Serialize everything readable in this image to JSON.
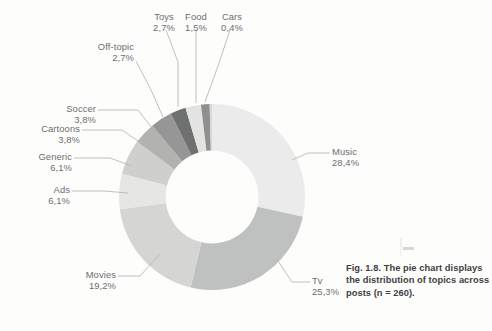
{
  "figure": {
    "caption": "Fig. 1.8. The pie chart displays the distribution of topics across posts (n = 260)."
  },
  "chart_data": {
    "type": "pie",
    "title": "",
    "subtitle": "",
    "xlabel": "",
    "ylabel": "",
    "legend_position": "none",
    "grid": false,
    "donut": true,
    "inner_radius_ratio": 0.5,
    "total_n": 260,
    "value_unit": "percent",
    "decimal_separator": ",",
    "start_angle_deg": -90,
    "direction": "clockwise",
    "categories": [
      "Music",
      "Tv",
      "Movies",
      "Ads",
      "Generic",
      "Cartoons",
      "Soccer",
      "Off-topic",
      "Toys",
      "Food",
      "Cars"
    ],
    "values": [
      28.4,
      25.3,
      19.2,
      6.1,
      6.1,
      3.8,
      3.8,
      2.7,
      2.7,
      1.5,
      0.4
    ],
    "value_labels": [
      "28,4%",
      "25,3%",
      "19,2%",
      "6,1%",
      "6,1%",
      "3,8%",
      "3,8%",
      "2,7%",
      "2,7%",
      "1,5%",
      "0,4%"
    ],
    "colors": [
      "#ebebeb",
      "#bfc0c0",
      "#d5d6d4",
      "#e6e7e5",
      "#cfd0ce",
      "#b2b3b1",
      "#959695",
      "#6f7170",
      "#e3e4e2",
      "#8e8f8e",
      "#d9dad8"
    ],
    "slices": [
      {
        "label": "Music",
        "value": 28.4,
        "value_label": "28,4%",
        "color": "#ebebeb"
      },
      {
        "label": "Tv",
        "value": 25.3,
        "value_label": "25,3%",
        "color": "#bfc0c0"
      },
      {
        "label": "Movies",
        "value": 19.2,
        "value_label": "19,2%",
        "color": "#d5d6d4"
      },
      {
        "label": "Ads",
        "value": 6.1,
        "value_label": "6,1%",
        "color": "#e6e7e5"
      },
      {
        "label": "Generic",
        "value": 6.1,
        "value_label": "6,1%",
        "color": "#cfd0ce"
      },
      {
        "label": "Cartoons",
        "value": 3.8,
        "value_label": "3,8%",
        "color": "#b2b3b1"
      },
      {
        "label": "Soccer",
        "value": 3.8,
        "value_label": "3,8%",
        "color": "#959695"
      },
      {
        "label": "Off-topic",
        "value": 2.7,
        "value_label": "2,7%",
        "color": "#6f7170"
      },
      {
        "label": "Toys",
        "value": 2.7,
        "value_label": "2,7%",
        "color": "#e3e4e2"
      },
      {
        "label": "Food",
        "value": 1.5,
        "value_label": "1,5%",
        "color": "#8e8f8e"
      },
      {
        "label": "Cars",
        "value": 0.4,
        "value_label": "0,4%",
        "color": "#d9dad8"
      }
    ]
  },
  "labels": {
    "music": {
      "name": "Music",
      "value": "28,4%"
    },
    "tv": {
      "name": "Tv",
      "value": "25,3%"
    },
    "movies": {
      "name": "Movies",
      "value": "19,2%"
    },
    "ads": {
      "name": "Ads",
      "value": "6,1%"
    },
    "generic": {
      "name": "Generic",
      "value": "6,1%"
    },
    "cartoons": {
      "name": "Cartoons",
      "value": "3,8%"
    },
    "soccer": {
      "name": "Soccer",
      "value": "3,8%"
    },
    "offtopic": {
      "name": "Off-topic",
      "value": "2,7%"
    },
    "toys": {
      "name": "Toys",
      "value": "2,7%"
    },
    "food": {
      "name": "Food",
      "value": "1,5%"
    },
    "cars": {
      "name": "Cars",
      "value": "0,4%"
    }
  },
  "style": {
    "background": "#fdfdfb",
    "label_color": "#6d6e70",
    "caption_color": "#3f3f41",
    "leader_color": "#b9bab8"
  }
}
